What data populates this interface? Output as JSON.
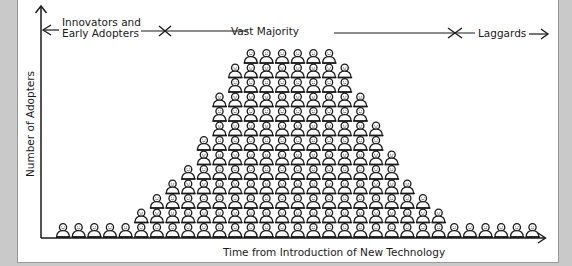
{
  "segments": [
    {
      "label_line1": "Innovators and",
      "label_line2": "Early Adopters"
    },
    {
      "label_line1": "Vast Majority"
    },
    {
      "label_line1": "Laggards"
    }
  ],
  "axes": {
    "y_label": "Number of Adopters",
    "x_label": "Time from Introduction of New Technology"
  },
  "colors": {
    "background": "#c9c9c9",
    "panel": "#ffffff",
    "ink": "#1a1a1a"
  },
  "crowd": {
    "icon": "person-icon",
    "figure_step_px": 15.65,
    "grid_origin_x": 57,
    "rows_from_bottom": [
      {
        "start_col": 0,
        "count": 31
      },
      {
        "start_col": 5,
        "count": 20
      },
      {
        "start_col": 6,
        "count": 18
      },
      {
        "start_col": 7,
        "count": 16
      },
      {
        "start_col": 8,
        "count": 14
      },
      {
        "start_col": 9,
        "count": 13
      },
      {
        "start_col": 9,
        "count": 12
      },
      {
        "start_col": 10,
        "count": 11
      },
      {
        "start_col": 10,
        "count": 10
      },
      {
        "start_col": 10,
        "count": 10
      },
      {
        "start_col": 11,
        "count": 8
      },
      {
        "start_col": 11,
        "count": 8
      },
      {
        "start_col": 12,
        "count": 6
      }
    ]
  }
}
